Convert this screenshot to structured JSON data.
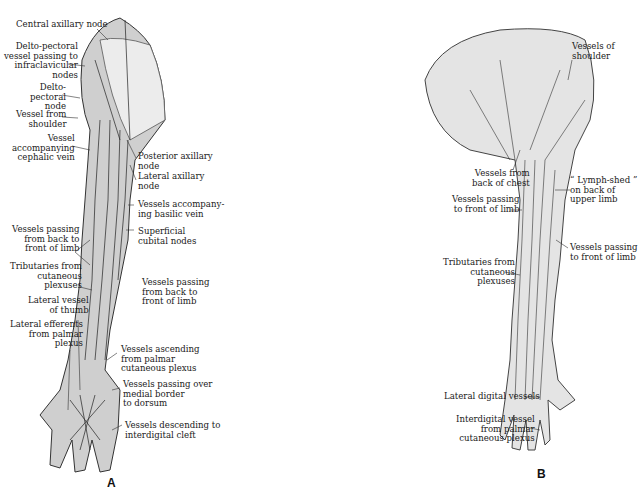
{
  "figure": {
    "panels": [
      {
        "letter": "A",
        "labels": [
          "Central axillary node",
          "Delto-pectoral\nvessel passing to\ninfraclavicular\nnodes",
          "Delto-\npectoral\nnode",
          "Vessel from\nshoulder",
          "Vessel\naccompanying\ncephalic vein",
          "Posterior axillary\nnode",
          "Lateral axillary\nnode",
          "Vessels accompany-\ning basilic vein",
          "Superficial\ncubital nodes",
          "Vessels passing\nfrom back to\nfront of limb",
          "Tributaries from\ncutaneous\nplexuses",
          "Vessels passing\nfrom back to\nfront of limb",
          "Lateral vessel\nof thumb",
          "Lateral efferents\nfrom palmar\nplexus",
          "Vessels ascending\nfrom palmar\ncutaneous plexus",
          "Vessels passing over\nmedial border\nto dorsum",
          "Vessels descending to\ninterdigital cleft"
        ]
      },
      {
        "letter": "B",
        "labels": [
          "Vessels of\nshoulder",
          "Vessels from\nback of chest",
          "“ Lymph-shed ”\non back of\nupper limb",
          "Vessels passing\nto front of limb",
          "Vessels passing\nto front of limb",
          "Tributaries from\ncutaneous\nplexuses",
          "Lateral digital vessels",
          "Interdigital vessel\nfrom palmar\ncutaneous plexus"
        ]
      }
    ]
  }
}
